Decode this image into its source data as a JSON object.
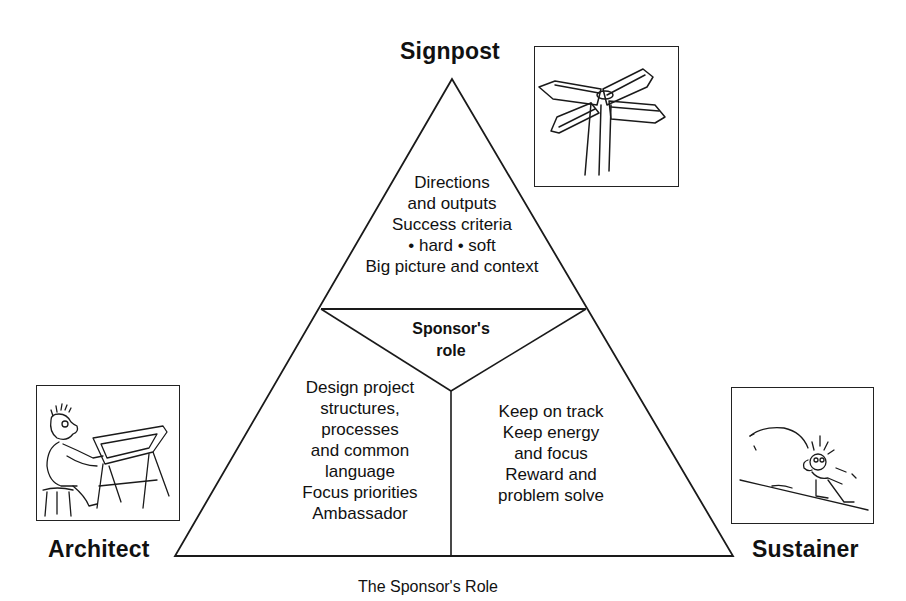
{
  "diagram": {
    "caption": "The Sponsor's Role",
    "center": {
      "line1": "Sponsor's",
      "line2": "role"
    },
    "corners": {
      "top": {
        "label": "Signpost",
        "icon": "signpost-illustration"
      },
      "left": {
        "label": "Architect",
        "icon": "architect-at-drafting-table-illustration"
      },
      "right": {
        "label": "Sustainer",
        "icon": "person-pushing-boulder-uphill-illustration"
      }
    },
    "sections": {
      "top": {
        "lines": [
          "Directions",
          "and outputs",
          "Success criteria",
          "• hard • soft",
          "Big picture and context"
        ]
      },
      "left": {
        "lines": [
          "Design project",
          "structures,",
          "processes",
          "and common",
          "language",
          "Focus priorities",
          "Ambassador"
        ]
      },
      "right": {
        "lines": [
          "Keep on track",
          "Keep energy",
          "and focus",
          "Reward and",
          "problem solve"
        ]
      }
    },
    "colors": {
      "line": "#1a1a1a",
      "background": "#ffffff",
      "text": "#111111"
    }
  }
}
